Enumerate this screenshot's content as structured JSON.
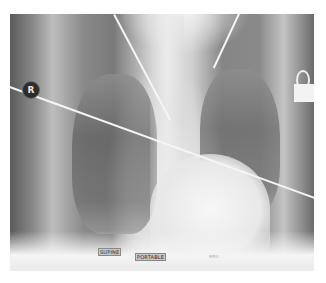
{
  "image": {
    "type": "chest-radiograph",
    "view": "AP",
    "background": "#ffffff"
  },
  "markers": {
    "side_marker": "R"
  },
  "labels": {
    "position": "SUPINE",
    "technique": "PORTABLE",
    "small_text": "MRU"
  }
}
